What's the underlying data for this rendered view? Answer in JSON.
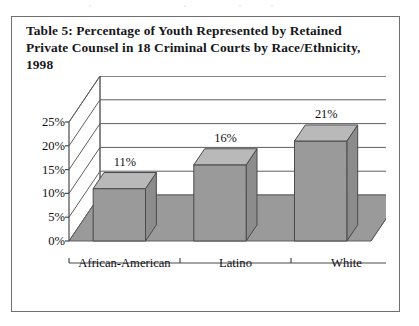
{
  "figure": {
    "caption": "Table 5: Percentage of Youth Represented by Retained Private Counsel in 18 Criminal Courts by Race/Ethnicity, 1998"
  },
  "colors": {
    "bar_front": "#9a9a9a",
    "bar_top": "#b9b9b9",
    "bar_side": "#8c8c8c",
    "floor": "#9a9a9a",
    "wall": "#ffffff",
    "gridline": "#5f5f63",
    "axis": "#4a4a4e",
    "border": "#6f6f72",
    "text": "#17171a"
  },
  "chart_data": {
    "type": "bar",
    "title": "Table 5: Percentage of Youth Represented by Retained Private Counsel in 18 Criminal Courts by Race/Ethnicity, 1998",
    "xlabel": "",
    "ylabel": "",
    "categories": [
      "African-American",
      "Latino",
      "White"
    ],
    "values": [
      11,
      16,
      21
    ],
    "value_labels": [
      "11%",
      "16%",
      "21%"
    ],
    "ylim": [
      0,
      25
    ],
    "ytick_values": [
      0,
      5,
      10,
      15,
      20,
      25
    ],
    "ytick_labels": [
      "0%",
      "5%",
      "10%",
      "15%",
      "20%",
      "25%"
    ],
    "grid": true,
    "legend": "none",
    "three_d": true,
    "units": "percent"
  }
}
